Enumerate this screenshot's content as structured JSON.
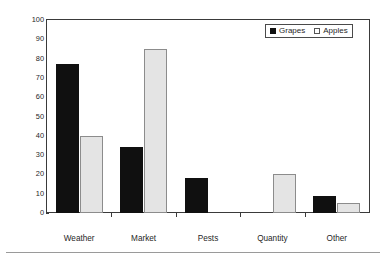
{
  "chart_data": {
    "type": "bar",
    "title": "",
    "subtitle": "",
    "xlabel": "",
    "ylabel": "Percent of respondents",
    "categories": [
      "Weather",
      "Market",
      "Pests",
      "Quantity",
      "Other"
    ],
    "series": [
      {
        "name": "Grapes",
        "color": "#101010",
        "values": [
          77,
          34,
          18,
          0,
          9
        ]
      },
      {
        "name": "Apples",
        "color": "#e4e4e4",
        "values": [
          40,
          85,
          0,
          20,
          5
        ]
      }
    ],
    "ylim": [
      0,
      100
    ],
    "ytick_step": 10,
    "ytick_labels": [
      "0",
      "10",
      "20",
      "30",
      "40",
      "50",
      "60",
      "70",
      "80",
      "90",
      "100"
    ],
    "grid": false,
    "legend_position": "top-right",
    "legend_entries": [
      "Grapes",
      "Apples"
    ],
    "frame": true
  },
  "axes": {
    "y_title": "Percent of respondents"
  },
  "legend": {
    "items": [
      {
        "label": "Grapes",
        "swatch": "filled-square-black"
      },
      {
        "label": "Apples",
        "swatch": "outlined-square-white"
      }
    ]
  }
}
